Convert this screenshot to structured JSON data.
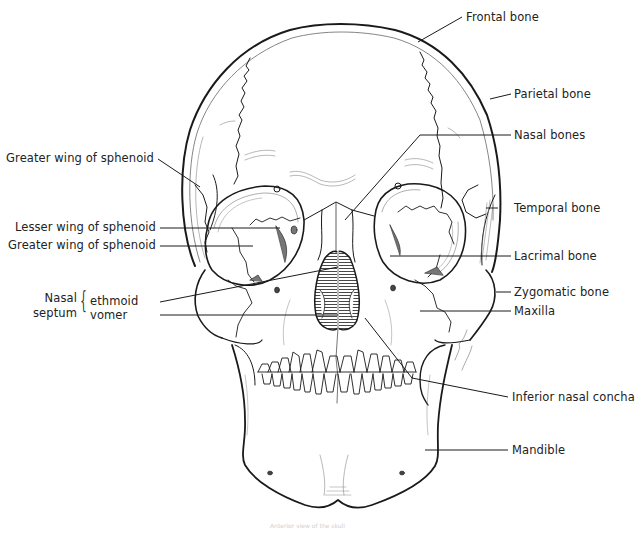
{
  "figure": {
    "caption": "Anterior view of the skull"
  },
  "labels": {
    "frontal_bone": "Frontal bone",
    "parietal_bone": "Parietal bone",
    "nasal_bones": "Nasal bones",
    "greater_wing_upper": "Greater wing of sphenoid",
    "temporal_bone": "Temporal bone",
    "lesser_wing": "Lesser wing of sphenoid",
    "greater_wing_lower": "Greater wing of sphenoid",
    "lacrimal_bone": "Lacrimal bone",
    "nasal_septum_group": "Nasal septum",
    "nasal_septum_word1": "Nasal",
    "nasal_septum_word2": "septum",
    "ethmoid": "ethmoid",
    "vomer": "vomer",
    "zygomatic_bone": "Zygomatic bone",
    "maxilla": "Maxilla",
    "inferior_nasal_concha": "Inferior nasal concha",
    "mandible": "Mandible"
  },
  "colors": {
    "line": "#1a1a1a",
    "text": "#222222",
    "shade": "#666666",
    "background": "#ffffff"
  }
}
